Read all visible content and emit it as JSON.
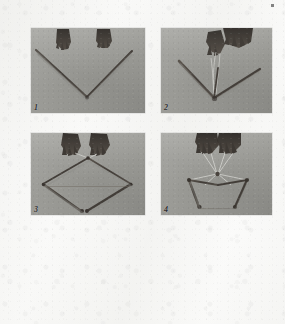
{
  "page": {
    "background_color": "#fafaf9",
    "type": "scanned-book-page",
    "artifacts": [
      {
        "name": "scan-speck",
        "x": 271,
        "y": 4
      }
    ]
  },
  "figure": {
    "name": "kite-frame-assembly-sequence",
    "layout": "2x2",
    "panel_count": 4,
    "panels": [
      {
        "number": "1",
        "caption": "",
        "scene": "Two hands above a V-shaped pair of rods joined at the bottom vertex on a gray surface",
        "hands": 2,
        "rods": 2,
        "string": false
      },
      {
        "number": "2",
        "caption": "",
        "scene": "Hands binding a third rod onto the V joint; spar angles out to the right",
        "hands": 2,
        "rods": 3,
        "string": true
      },
      {
        "number": "3",
        "caption": "",
        "scene": "Completed diamond frame with horizontal cross spar; two hands hold the top corner",
        "hands": 2,
        "rods": 4,
        "string": true
      },
      {
        "number": "4",
        "caption": "",
        "scene": "Finished kite frame suspended from bridle strings converging to a point held by two hands",
        "hands": 2,
        "rods": 4,
        "string": true
      }
    ]
  },
  "colors": {
    "paper": "#fafaf9",
    "photo_background": "#9e9e9a",
    "rod": "#4a4540",
    "hand": "#3b3631",
    "string": "#d8d8d4",
    "number_text": "#2c2c2c"
  }
}
